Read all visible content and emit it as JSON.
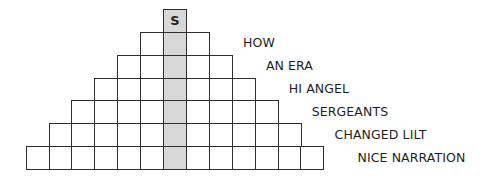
{
  "puzzle": {
    "type": "word-pyramid",
    "rows": 7,
    "shaded_column_color": "#d8d8d8",
    "border_color": "#2e2e2e",
    "top_letter": "S",
    "clues": [
      {
        "row": 1,
        "text": "HOW"
      },
      {
        "row": 2,
        "text": "AN ERA"
      },
      {
        "row": 3,
        "text": "HI ANGEL"
      },
      {
        "row": 4,
        "text": "SERGEANTS"
      },
      {
        "row": 5,
        "text": "CHANGED LILT"
      },
      {
        "row": 6,
        "text": "NICE NARRATION"
      }
    ]
  }
}
